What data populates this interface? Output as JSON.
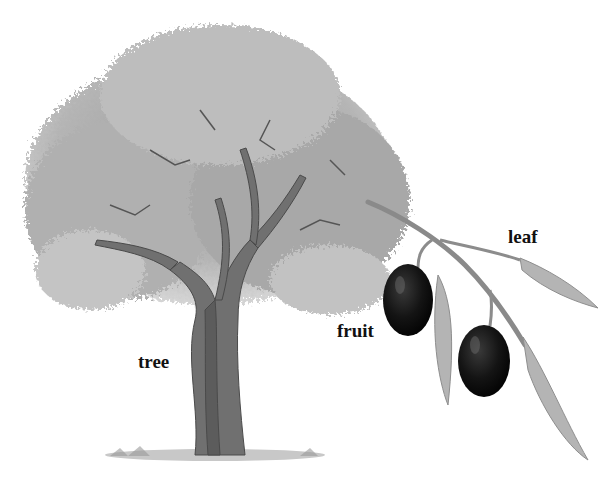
{
  "diagram": {
    "labels": {
      "tree": "tree",
      "fruit": "fruit",
      "leaf": "leaf"
    },
    "colors": {
      "background": "#ffffff",
      "foliage": "#a9a9a9",
      "trunk": "#6e6e6e",
      "fruit": "#141414",
      "leaf": "#b4b4b4",
      "text": "#111111"
    }
  }
}
